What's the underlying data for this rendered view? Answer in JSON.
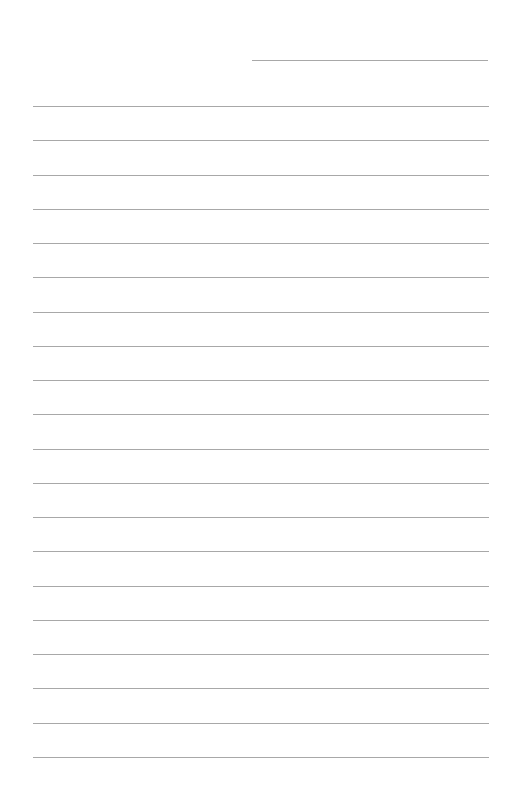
{
  "page": {
    "type": "lined-paper",
    "background_color": "#ffffff",
    "line_color": "#a8a8a8",
    "header_line_count": 1,
    "ruled_line_count": 20,
    "text_content": []
  }
}
